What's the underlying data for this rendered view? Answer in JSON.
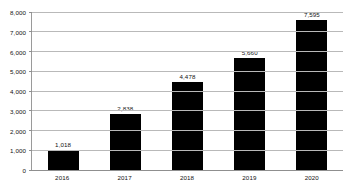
{
  "chart_data": {
    "type": "bar",
    "title": "",
    "subtitle": "",
    "xlabel": "",
    "ylabel": "",
    "categories": [
      "2016",
      "2017",
      "2018",
      "2019",
      "2020"
    ],
    "values": [
      1018,
      2838,
      4478,
      5660,
      7595
    ],
    "value_labels": [
      "1,018",
      "2,838",
      "4,478",
      "5,660",
      "7,595"
    ],
    "ylim": [
      0,
      8000
    ],
    "ytick_values": [
      0,
      1000,
      2000,
      3000,
      4000,
      5000,
      6000,
      7000,
      8000
    ],
    "ytick_labels": [
      "0",
      "1,000",
      "2,000",
      "3,000",
      "4,000",
      "5,000",
      "6,000",
      "7,000",
      "8,000"
    ],
    "grid": true,
    "legend": false,
    "legend_position": "none",
    "series": [
      {
        "name": "",
        "values": [
          1018,
          2838,
          4478,
          5660,
          7595
        ]
      }
    ],
    "colors": {
      "bar": "#000000",
      "gridline": "#b9b9b9",
      "axis": "#8f8f8f",
      "text": "#111111",
      "background": "#ffffff"
    }
  }
}
